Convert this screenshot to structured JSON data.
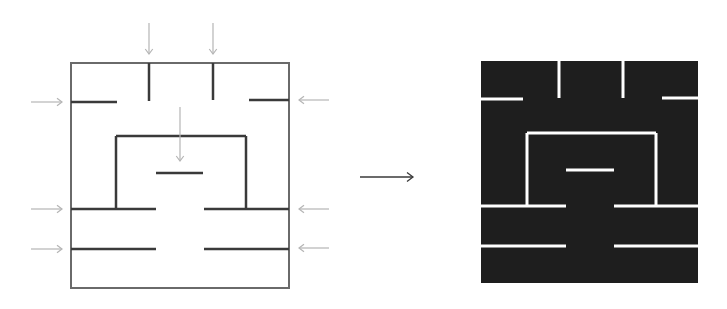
{
  "diagram": {
    "colors": {
      "background": "#ffffff",
      "maze_wall": "#3a3a3a",
      "hint_arrow": "#b5b5b5",
      "transform_arrow": "#3a3a3a",
      "inverted_fill": "#1e1e1e",
      "inverted_wall": "#ffffff"
    },
    "left_maze": {
      "label": "line-maze",
      "box": {
        "x": 71,
        "y": 63,
        "w": 218,
        "h": 225
      },
      "walls": [
        {
          "x1": 149,
          "y1": 63,
          "x2": 149,
          "y2": 101
        },
        {
          "x1": 213,
          "y1": 63,
          "x2": 213,
          "y2": 100
        },
        {
          "x1": 71,
          "y1": 102,
          "x2": 117,
          "y2": 102
        },
        {
          "x1": 249,
          "y1": 100,
          "x2": 289,
          "y2": 100
        },
        {
          "x1": 116,
          "y1": 136,
          "x2": 246,
          "y2": 136
        },
        {
          "x1": 116,
          "y1": 136,
          "x2": 116,
          "y2": 209
        },
        {
          "x1": 246,
          "y1": 136,
          "x2": 246,
          "y2": 209
        },
        {
          "x1": 156,
          "y1": 173,
          "x2": 203,
          "y2": 173
        },
        {
          "x1": 71,
          "y1": 209,
          "x2": 156,
          "y2": 209
        },
        {
          "x1": 204,
          "y1": 209,
          "x2": 289,
          "y2": 209
        },
        {
          "x1": 71,
          "y1": 249,
          "x2": 156,
          "y2": 249
        },
        {
          "x1": 204,
          "y1": 249,
          "x2": 289,
          "y2": 249
        }
      ],
      "arrows": [
        {
          "direction": "down",
          "x1": 149,
          "y1": 23,
          "x2": 149,
          "y2": 54
        },
        {
          "direction": "down",
          "x1": 213,
          "y1": 23,
          "x2": 213,
          "y2": 54
        },
        {
          "direction": "down",
          "x1": 180,
          "y1": 107,
          "x2": 180,
          "y2": 161
        },
        {
          "direction": "right",
          "x1": 31,
          "y1": 102,
          "x2": 62,
          "y2": 102
        },
        {
          "direction": "right",
          "x1": 31,
          "y1": 209,
          "x2": 62,
          "y2": 209
        },
        {
          "direction": "right",
          "x1": 31,
          "y1": 249,
          "x2": 62,
          "y2": 249
        },
        {
          "direction": "left",
          "x1": 329,
          "y1": 100,
          "x2": 299,
          "y2": 100
        },
        {
          "direction": "left",
          "x1": 329,
          "y1": 209,
          "x2": 299,
          "y2": 209
        },
        {
          "direction": "left",
          "x1": 329,
          "y1": 248,
          "x2": 299,
          "y2": 248
        }
      ]
    },
    "transform_arrow": {
      "x1": 360,
      "y1": 177,
      "x2": 413,
      "y2": 177
    },
    "right_maze": {
      "label": "inverted-maze",
      "box": {
        "x": 481,
        "y": 61,
        "w": 217,
        "h": 222
      },
      "walls": [
        {
          "x1": 559,
          "y1": 61,
          "x2": 559,
          "y2": 98
        },
        {
          "x1": 623,
          "y1": 61,
          "x2": 623,
          "y2": 98
        },
        {
          "x1": 481,
          "y1": 99,
          "x2": 523,
          "y2": 99
        },
        {
          "x1": 662,
          "y1": 98,
          "x2": 698,
          "y2": 98
        },
        {
          "x1": 527,
          "y1": 133,
          "x2": 656,
          "y2": 133
        },
        {
          "x1": 527,
          "y1": 133,
          "x2": 527,
          "y2": 206
        },
        {
          "x1": 656,
          "y1": 133,
          "x2": 656,
          "y2": 206
        },
        {
          "x1": 566,
          "y1": 170,
          "x2": 614,
          "y2": 170
        },
        {
          "x1": 481,
          "y1": 206,
          "x2": 566,
          "y2": 206
        },
        {
          "x1": 614,
          "y1": 206,
          "x2": 698,
          "y2": 206
        },
        {
          "x1": 481,
          "y1": 246,
          "x2": 566,
          "y2": 246
        },
        {
          "x1": 614,
          "y1": 246,
          "x2": 698,
          "y2": 246
        }
      ]
    }
  }
}
